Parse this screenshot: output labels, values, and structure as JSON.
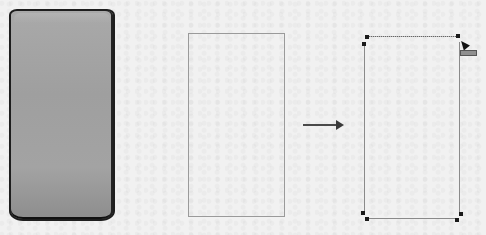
{
  "canvas": {
    "background": "#f1f1f1"
  },
  "shapes": {
    "phone": {
      "type": "rounded-phone-body",
      "fill": "#a3a3a3",
      "stroke": "#1e1e1e"
    },
    "rectangle_plain": {
      "type": "rectangle",
      "stroke": "#9a9a9a"
    },
    "arrow": {
      "direction": "right",
      "color": "#3a3a3a"
    },
    "rectangle_selected": {
      "type": "rectangle",
      "stroke": "#8a8a8a",
      "handles": [
        "top-left",
        "top-right",
        "bottom-left",
        "bottom-right"
      ],
      "handle_color": "#1a1a1a"
    }
  },
  "cursor": {
    "type": "resize-pointer",
    "tag_color": "#8f8f8f"
  }
}
